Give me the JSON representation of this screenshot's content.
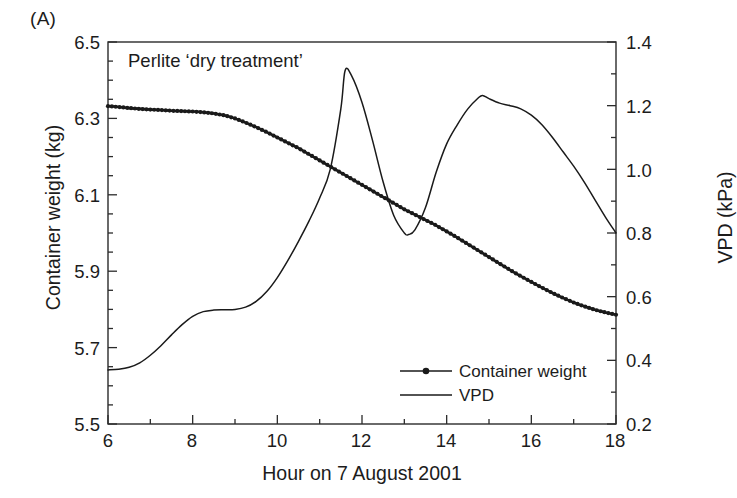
{
  "panel": {
    "label": "(A)"
  },
  "annotation": {
    "text": "Perlite ‘dry treatment’"
  },
  "axes": {
    "x": {
      "label": "Hour on 7 August 2001",
      "ticks": [
        "6",
        "8",
        "10",
        "12",
        "14",
        "16",
        "18"
      ]
    },
    "y_left": {
      "label": "Container weight (kg)",
      "ticks": [
        "6.5",
        "6.3",
        "6.1",
        "5.9",
        "5.7",
        "5.5"
      ]
    },
    "y_right": {
      "label": "VPD (kPa)",
      "ticks": [
        "1.4",
        "1.2",
        "1.0",
        "0.8",
        "0.6",
        "0.4",
        "0.2"
      ]
    }
  },
  "legend": {
    "items": [
      {
        "label": "Container weight",
        "marker": "line-with-dot",
        "color": "#1a1a1a"
      },
      {
        "label": "VPD",
        "marker": "line",
        "color": "#1a1a1a"
      }
    ]
  },
  "chart_data": {
    "type": "line",
    "title": "Perlite ‘dry treatment’",
    "xlabel": "Hour on 7 August 2001",
    "ylabel": "Container weight (kg)",
    "ylabel_secondary": "VPD (kPa)",
    "xlim": [
      6,
      18
    ],
    "ylim": [
      5.5,
      6.5
    ],
    "ylim_secondary": [
      0.2,
      1.4
    ],
    "xticks": [
      6,
      8,
      10,
      12,
      14,
      16,
      18
    ],
    "xticks_minor_step": 1,
    "yticks": [
      5.5,
      5.7,
      5.9,
      6.1,
      6.3,
      6.5
    ],
    "yticks_minor_step": 0.05,
    "yticks_secondary": [
      0.2,
      0.4,
      0.6,
      0.8,
      1.0,
      1.2,
      1.4
    ],
    "yticks_secondary_minor_step": 0.1,
    "grid": false,
    "legend_position": "bottom-center",
    "series": [
      {
        "name": "Container weight",
        "axis": "left",
        "units": "kg",
        "marker": "filled-circle",
        "x": [
          6.0,
          6.25,
          6.5,
          6.75,
          7.0,
          7.25,
          7.5,
          7.75,
          8.0,
          8.25,
          8.5,
          8.75,
          9.0,
          9.25,
          9.5,
          9.75,
          10.0,
          10.25,
          10.5,
          10.75,
          11.0,
          11.25,
          11.5,
          11.75,
          12.0,
          12.25,
          12.5,
          12.75,
          13.0,
          13.25,
          13.5,
          13.75,
          14.0,
          14.25,
          14.5,
          14.75,
          15.0,
          15.25,
          15.5,
          15.75,
          16.0,
          16.25,
          16.5,
          16.75,
          17.0,
          17.25,
          17.5,
          17.75,
          18.0
        ],
        "y": [
          6.332,
          6.33,
          6.327,
          6.325,
          6.323,
          6.322,
          6.32,
          6.319,
          6.318,
          6.316,
          6.313,
          6.308,
          6.3,
          6.289,
          6.277,
          6.264,
          6.25,
          6.236,
          6.222,
          6.206,
          6.19,
          6.174,
          6.158,
          6.142,
          6.126,
          6.11,
          6.094,
          6.078,
          6.062,
          6.048,
          6.034,
          6.02,
          6.004,
          5.988,
          5.971,
          5.954,
          5.937,
          5.92,
          5.903,
          5.887,
          5.872,
          5.857,
          5.843,
          5.83,
          5.818,
          5.808,
          5.799,
          5.792,
          5.786
        ]
      },
      {
        "name": "VPD",
        "axis": "right",
        "units": "kPa",
        "marker": "none",
        "x": [
          6.0,
          6.25,
          6.5,
          6.75,
          7.0,
          7.25,
          7.5,
          7.75,
          8.0,
          8.25,
          8.5,
          8.75,
          9.0,
          9.25,
          9.5,
          9.75,
          10.0,
          10.25,
          10.5,
          10.75,
          11.0,
          11.25,
          11.5,
          11.6,
          11.75,
          12.0,
          12.25,
          12.5,
          12.75,
          13.0,
          13.1,
          13.25,
          13.5,
          13.75,
          14.0,
          14.25,
          14.5,
          14.75,
          14.85,
          15.0,
          15.25,
          15.5,
          15.75,
          16.0,
          16.25,
          16.5,
          16.75,
          17.0,
          17.25,
          17.5,
          17.75,
          18.0
        ],
        "y": [
          0.37,
          0.372,
          0.378,
          0.392,
          0.416,
          0.446,
          0.48,
          0.512,
          0.538,
          0.553,
          0.558,
          0.559,
          0.56,
          0.567,
          0.585,
          0.616,
          0.66,
          0.714,
          0.774,
          0.838,
          0.91,
          1.0,
          1.19,
          1.31,
          1.295,
          1.21,
          1.09,
          0.96,
          0.855,
          0.8,
          0.795,
          0.81,
          0.88,
          0.99,
          1.08,
          1.14,
          1.19,
          1.225,
          1.232,
          1.222,
          1.208,
          1.2,
          1.19,
          1.17,
          1.14,
          1.1,
          1.055,
          1.01,
          0.96,
          0.905,
          0.85,
          0.8
        ]
      }
    ]
  },
  "geometry": {
    "plot_left": 108,
    "plot_right": 616,
    "plot_top": 42,
    "plot_bottom": 424
  }
}
